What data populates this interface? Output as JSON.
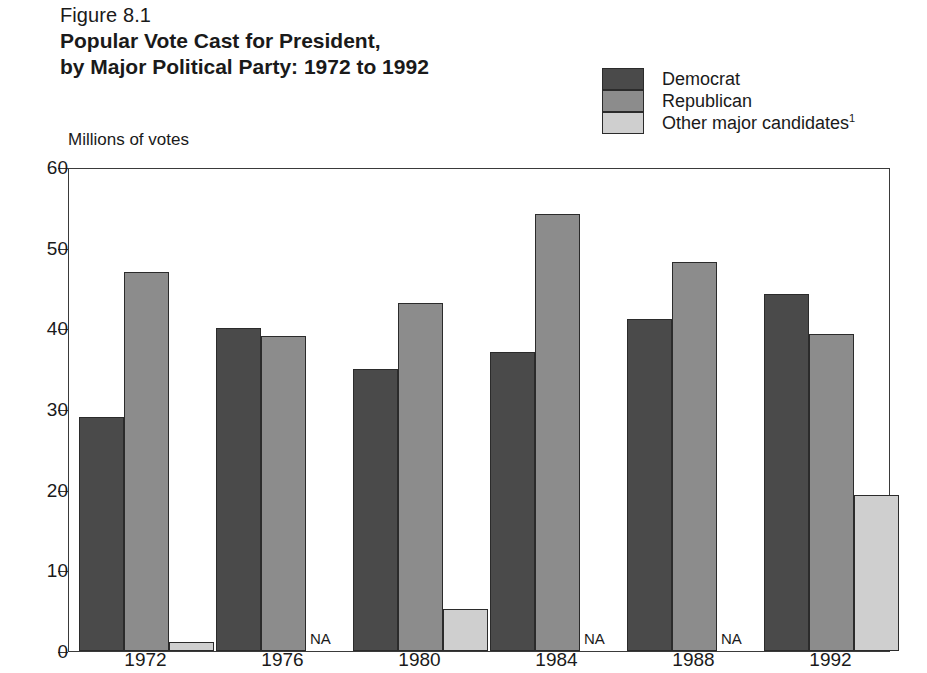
{
  "figure": {
    "number": "Figure 8.1",
    "title_line1": "Popular Vote Cast for President,",
    "title_line2": "by Major Political Party:  1972 to 1992"
  },
  "legend": {
    "items": [
      {
        "label": "Democrat",
        "color": "#4a4a4a",
        "swatch_name": "legend-swatch-democrat"
      },
      {
        "label": "Republican",
        "color": "#8c8c8c",
        "swatch_name": "legend-swatch-republican"
      },
      {
        "label": "Other major candidates",
        "superscript": "1",
        "color": "#cfcfcf",
        "swatch_name": "legend-swatch-other"
      }
    ]
  },
  "na_label": "NA",
  "chart_data": {
    "type": "bar",
    "title": "Popular Vote Cast for President, by Major Political Party:  1972 to 1992",
    "xlabel": "",
    "ylabel": "Millions of votes",
    "ylim": [
      0,
      60
    ],
    "yticks": [
      0,
      10,
      20,
      30,
      40,
      50,
      60
    ],
    "ytick_labels": [
      "0",
      "10",
      "20",
      "30",
      "40",
      "50",
      "60"
    ],
    "grid": false,
    "legend_position": "top-right",
    "categories": [
      "1972",
      "1976",
      "1980",
      "1984",
      "1988",
      "1992"
    ],
    "series": [
      {
        "name": "Democrat",
        "color": "#4a4a4a",
        "values": [
          29.0,
          40.0,
          35.0,
          37.1,
          41.2,
          44.3
        ]
      },
      {
        "name": "Republican",
        "color": "#8c8c8c",
        "values": [
          47.0,
          39.1,
          43.2,
          54.2,
          48.2,
          39.3
        ]
      },
      {
        "name": "Other major candidates",
        "color": "#cfcfcf",
        "values": [
          1.1,
          null,
          5.2,
          null,
          null,
          19.4
        ]
      }
    ],
    "na_categories": [
      "1976",
      "1984",
      "1988"
    ],
    "annotations": [
      "NA shown for Other major candidates in 1976, 1984 and 1988"
    ]
  }
}
